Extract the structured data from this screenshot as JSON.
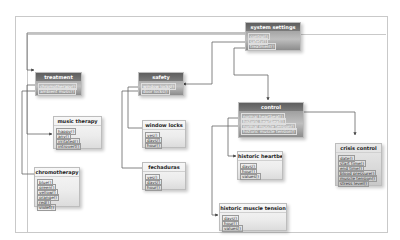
{
  "diagram": {
    "boxes": {
      "system_settings": {
        "title": "system settings",
        "items": [
          "control()",
          "safety()",
          "treatment()"
        ]
      },
      "treatment": {
        "title": "treatment",
        "items": [
          "chromotherapy()",
          "ambient music()"
        ]
      },
      "safety": {
        "title": "safety",
        "items": [
          "window locks()",
          "door locks()"
        ]
      },
      "control": {
        "title": "control",
        "items": [
          "normal heartbeat()",
          "historic heartbeat()",
          "normal muscle tension()",
          "historic muscle tension()"
        ]
      },
      "music_therapy": {
        "title": "music therapy",
        "items": [
          "happy()",
          "any()",
          "irritated()",
          "introvert()"
        ]
      },
      "chromotherapy": {
        "title": "chromotherapy",
        "items": [
          "blue()",
          "green()",
          "yellow()",
          "orange()",
          "red()",
          "violet()"
        ]
      },
      "window_locks": {
        "title": "window locks",
        "items": [
          "yes()",
          "days()",
          "hour()"
        ]
      },
      "fechaduras": {
        "title": "fechaduras",
        "items": [
          "yes()",
          "days()",
          "hour()"
        ]
      },
      "historic_heartbeat": {
        "title": "historic heartbeat",
        "items": [
          "days()",
          "hour()",
          "values()"
        ]
      },
      "historic_muscle_tension": {
        "title": "historic muscle tension",
        "items": [
          "days()",
          "hour()",
          "values()"
        ]
      },
      "crisis_control": {
        "title": "crisis control",
        "items": [
          "date()",
          "start time()",
          "end time()",
          "blood pressure()",
          "muscle tension()",
          "stress level()"
        ]
      }
    },
    "colors": {
      "dark_box": "#9a9a9a",
      "light_box": "#eeeeee",
      "frame": "#c9c9c9",
      "wire": "#555555"
    }
  }
}
